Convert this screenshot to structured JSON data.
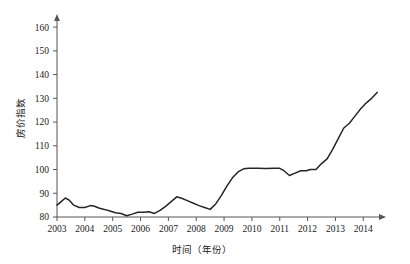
{
  "chart_data": {
    "type": "line",
    "title": "",
    "subtitle": "",
    "xlabel": "时间（年份）",
    "ylabel": "房价指数",
    "xlim": [
      2003,
      2014.6
    ],
    "ylim": [
      80,
      163
    ],
    "grid": false,
    "legend": false,
    "legend_position": "none",
    "line_color": "#262626",
    "axis_color": "#555555",
    "xticks": [
      2003,
      2004,
      2005,
      2006,
      2007,
      2008,
      2009,
      2010,
      2011,
      2012,
      2013,
      2014
    ],
    "xtick_labels": [
      "2003",
      "2004",
      "2005",
      "2006",
      "2007",
      "2008",
      "2009",
      "2010",
      "2011",
      "2012",
      "2013",
      "2014"
    ],
    "yticks": [
      80,
      90,
      100,
      110,
      120,
      130,
      140,
      150,
      160
    ],
    "ytick_labels": [
      "80",
      "90",
      "100",
      "110",
      "120",
      "130",
      "140",
      "150",
      "160"
    ],
    "series": [
      {
        "name": "房价指数",
        "x": [
          2003.0,
          2003.15,
          2003.3,
          2003.45,
          2003.6,
          2003.8,
          2004.0,
          2004.2,
          2004.35,
          2004.5,
          2004.7,
          2004.9,
          2005.1,
          2005.3,
          2005.5,
          2005.7,
          2005.9,
          2006.1,
          2006.3,
          2006.5,
          2006.7,
          2006.9,
          2007.1,
          2007.3,
          2007.5,
          2007.7,
          2007.9,
          2008.1,
          2008.3,
          2008.5,
          2008.7,
          2008.9,
          2009.1,
          2009.3,
          2009.5,
          2009.7,
          2009.9,
          2010.2,
          2010.5,
          2010.8,
          2011.0,
          2011.15,
          2011.35,
          2011.55,
          2011.75,
          2011.95,
          2012.1,
          2012.3,
          2012.5,
          2012.7,
          2012.9,
          2013.1,
          2013.3,
          2013.5,
          2013.7,
          2013.9,
          2014.1,
          2014.3,
          2014.5
        ],
        "y": [
          85.0,
          86.5,
          88.0,
          87.0,
          85.0,
          84.0,
          84.0,
          84.8,
          84.5,
          83.8,
          83.2,
          82.5,
          81.8,
          81.5,
          80.5,
          81.2,
          82.0,
          82.0,
          82.2,
          81.5,
          82.8,
          84.5,
          86.5,
          88.5,
          87.8,
          86.8,
          85.8,
          84.8,
          84.0,
          83.2,
          85.5,
          89.0,
          93.0,
          96.5,
          99.0,
          100.3,
          100.5,
          100.5,
          100.4,
          100.5,
          100.5,
          99.5,
          97.5,
          98.5,
          99.5,
          99.5,
          100.0,
          100.0,
          102.5,
          104.5,
          108.5,
          113.0,
          117.5,
          119.5,
          122.5,
          125.5,
          128.0,
          130.0,
          132.5
        ]
      }
    ]
  },
  "axis": {
    "y_label_text": "房价指数",
    "x_label_text": "时间（年份）"
  }
}
